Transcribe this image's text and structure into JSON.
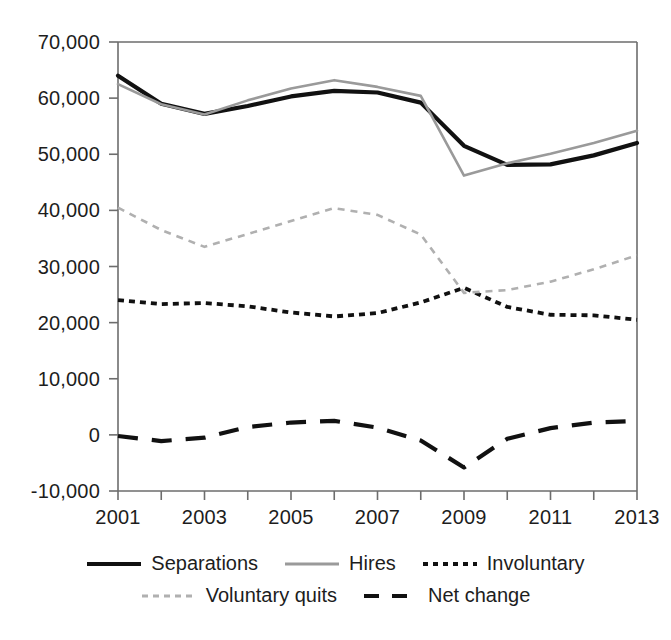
{
  "chart_data": {
    "type": "line",
    "title": "",
    "xlabel": "",
    "ylabel": "",
    "x": [
      2001,
      2002,
      2003,
      2004,
      2005,
      2006,
      2007,
      2008,
      2009,
      2010,
      2011,
      2012,
      2013
    ],
    "xlim": [
      2001,
      2013
    ],
    "ylim": [
      -10000,
      70000
    ],
    "grid": false,
    "legend_position": "bottom",
    "x_tick_labels": [
      "2001",
      "2003",
      "2005",
      "2007",
      "2009",
      "2011",
      "2013"
    ],
    "x_tick_values": [
      2001,
      2003,
      2005,
      2007,
      2009,
      2011,
      2013
    ],
    "x_minor_ticks": [
      2002,
      2004,
      2006,
      2008,
      2010,
      2012
    ],
    "y_tick_labels": [
      "70,000",
      "60,000",
      "50,000",
      "40,000",
      "30,000",
      "20,000",
      "10,000",
      "0",
      "-10,000"
    ],
    "y_tick_values": [
      70000,
      60000,
      50000,
      40000,
      30000,
      20000,
      10000,
      0,
      -10000
    ],
    "series": [
      {
        "name": "Separations",
        "style": "solid-thick",
        "color": "#111111",
        "values": [
          64000,
          59000,
          57200,
          58600,
          60300,
          61300,
          61000,
          59200,
          51500,
          48100,
          48200,
          49800,
          52000
        ]
      },
      {
        "name": "Hires",
        "style": "solid-gray",
        "color": "#9a9a9a",
        "values": [
          62500,
          58900,
          57100,
          59600,
          61700,
          63200,
          62000,
          60400,
          46200,
          48400,
          50100,
          52000,
          54200
        ]
      },
      {
        "name": "Involuntary",
        "style": "dotted-black",
        "color": "#111111",
        "values": [
          24000,
          23300,
          23500,
          22900,
          21800,
          21100,
          21700,
          23600,
          26200,
          22800,
          21400,
          21300,
          20500
        ]
      },
      {
        "name": "Voluntary quits",
        "style": "dashed-gray",
        "color": "#b0b0b0",
        "values": [
          40500,
          36500,
          33500,
          35800,
          38100,
          40400,
          39200,
          35700,
          25300,
          25800,
          27300,
          29500,
          32000
        ]
      },
      {
        "name": "Net change",
        "style": "dashed-black-long",
        "color": "#111111",
        "values": [
          -200,
          -1100,
          -500,
          1400,
          2200,
          2500,
          1300,
          -1000,
          -5800,
          -700,
          1200,
          2200,
          2500
        ]
      }
    ]
  },
  "axes": {
    "y_ticks": [
      {
        "label": "70,000",
        "value": 70000
      },
      {
        "label": "60,000",
        "value": 60000
      },
      {
        "label": "50,000",
        "value": 50000
      },
      {
        "label": "40,000",
        "value": 40000
      },
      {
        "label": "30,000",
        "value": 30000
      },
      {
        "label": "20,000",
        "value": 20000
      },
      {
        "label": "10,000",
        "value": 10000
      },
      {
        "label": "0",
        "value": 0
      },
      {
        "label": "-10,000",
        "value": -10000
      }
    ],
    "x_ticks": [
      {
        "label": "2001",
        "value": 2001
      },
      {
        "label": "2003",
        "value": 2003
      },
      {
        "label": "2005",
        "value": 2005
      },
      {
        "label": "2007",
        "value": 2007
      },
      {
        "label": "2009",
        "value": 2009
      },
      {
        "label": "2011",
        "value": 2011
      },
      {
        "label": "2013",
        "value": 2013
      }
    ]
  },
  "legend": {
    "row1": [
      {
        "label": "Separations",
        "swatch": "line-solid-thick-black"
      },
      {
        "label": "Hires",
        "swatch": "line-solid-gray"
      },
      {
        "label": "Involuntary",
        "swatch": "line-dotted-black"
      }
    ],
    "row2": [
      {
        "label": "Voluntary quits",
        "swatch": "line-dashed-gray"
      },
      {
        "label": "Net change",
        "swatch": "line-dashed-black-long"
      }
    ]
  }
}
